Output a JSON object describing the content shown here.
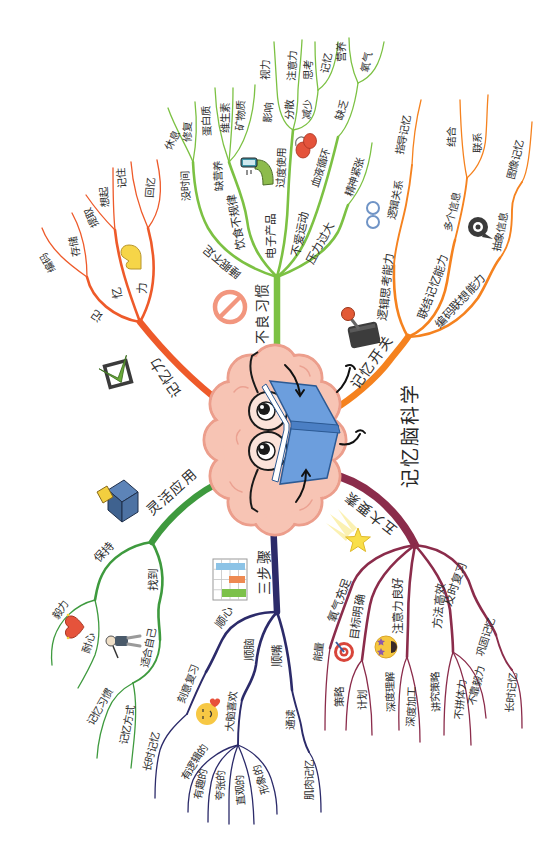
{
  "title": "记忆脑科学",
  "central_image": {
    "icon": "brain-reading-book-icon"
  },
  "branches": [
    {
      "label": "记忆力",
      "color": "#ee5a2a",
      "icon": "checkbox-icon",
      "children": [
        {
          "label": "记",
          "children": [
            {
              "label": "编码"
            },
            {
              "label": "存储"
            }
          ]
        },
        {
          "label": "忆",
          "children": [
            {
              "label": "提取"
            },
            {
              "label": "想起"
            }
          ]
        },
        {
          "label": "力",
          "icon": "flexed-arm-icon",
          "children": [
            {
              "label": "记住"
            },
            {
              "label": "回忆"
            }
          ]
        }
      ]
    },
    {
      "label": "不良习惯",
      "color": "#7cc143",
      "icon": "prohibition-icon",
      "children": [
        {
          "label": "睡眠不足",
          "children": [
            {
              "label": "没时间",
              "children": [
                {
                  "label": "休息"
                },
                {
                  "label": "修复"
                }
              ]
            }
          ]
        },
        {
          "label": "饮食不规律",
          "children": [
            {
              "label": "缺营养",
              "children": [
                {
                  "label": "蛋白质"
                },
                {
                  "label": "维生素"
                },
                {
                  "label": "矿物质"
                }
              ]
            }
          ]
        },
        {
          "label": "电子产品",
          "icon": "phone-hand-icon",
          "children": [
            {
              "label": "过度使用",
              "children": [
                {
                  "label": "影响",
                  "children": [
                    {
                      "label": "视力"
                    }
                  ]
                },
                {
                  "label": "分散",
                  "children": [
                    {
                      "label": "注意力"
                    }
                  ]
                },
                {
                  "label": "减少",
                  "children": [
                    {
                      "label": "思考"
                    },
                    {
                      "label": "记忆"
                    }
                  ]
                }
              ]
            }
          ]
        },
        {
          "label": "不爱运动",
          "icon": "lungs-icon",
          "children": [
            {
              "label": "血液循环",
              "children": [
                {
                  "label": "缺乏",
                  "children": [
                    {
                      "label": "营养"
                    },
                    {
                      "label": "氧气"
                    }
                  ]
                }
              ]
            }
          ]
        },
        {
          "label": "压力过大",
          "children": [
            {
              "label": "精神紧张"
            }
          ]
        }
      ]
    },
    {
      "label": "记忆开关",
      "color": "#f5821f",
      "icon": "joystick-icon",
      "children": [
        {
          "label": "逻辑思考能力",
          "icon": "glasses-icon",
          "children": [
            {
              "label": "逻辑关系",
              "children": [
                {
                  "label": "指导记忆"
                }
              ]
            }
          ]
        },
        {
          "label": "联结记忆能力",
          "children": [
            {
              "label": "多个信息",
              "children": [
                {
                  "label": "结合"
                },
                {
                  "label": "联系"
                }
              ]
            }
          ]
        },
        {
          "label": "编码联想能力",
          "icon": "eye-bubble-icon",
          "children": [
            {
              "label": "抽象信息",
              "children": [
                {
                  "label": "图像记忆"
                }
              ]
            }
          ]
        }
      ]
    },
    {
      "label": "五大要素",
      "color": "#8b2c4b",
      "icon": "shooting-star-icon",
      "children": [
        {
          "label": "氧气充足",
          "children": [
            {
              "label": "能量"
            }
          ]
        },
        {
          "label": "目标明确",
          "icon": "target-icon",
          "children": [
            {
              "label": "策略"
            },
            {
              "label": "计划"
            }
          ]
        },
        {
          "label": "注意力良好",
          "icon": "star-eyes-emoji-icon",
          "children": [
            {
              "label": "深度理解"
            },
            {
              "label": "深度加工"
            }
          ]
        },
        {
          "label": "方法高效",
          "children": [
            {
              "label": "讲究策略"
            },
            {
              "label": "不拼体力"
            },
            {
              "label": "不靠毅力"
            }
          ]
        },
        {
          "label": "及时复习",
          "children": [
            {
              "label": "巩固记忆",
              "children": [
                {
                  "label": "长时记忆"
                }
              ]
            }
          ]
        }
      ]
    },
    {
      "label": "三步骤",
      "color": "#2c2b6a",
      "icon": "schedule-chart-icon",
      "children": [
        {
          "label": "顺心",
          "children": [
            {
              "label": "刻意复习",
              "children": [
                {
                  "label": "长时记忆"
                }
              ]
            }
          ]
        },
        {
          "label": "顺脑",
          "icon": "smiley-heart-icon",
          "children": [
            {
              "label": "大脑喜欢",
              "children": [
                {
                  "label": "有逻辑的"
                },
                {
                  "label": "有趣的"
                },
                {
                  "label": "夸张的"
                },
                {
                  "label": "直观的"
                },
                {
                  "label": "形象的"
                }
              ]
            }
          ]
        },
        {
          "label": "顺嘴",
          "children": [
            {
              "label": "通读",
              "children": [
                {
                  "label": "肌肉记忆"
                }
              ]
            }
          ]
        }
      ]
    },
    {
      "label": "灵活应用",
      "color": "#3e9a3e",
      "icon": "box-icon",
      "children": [
        {
          "label": "保持",
          "icon": "heart-icon",
          "children": [
            {
              "label": "毅力"
            },
            {
              "label": "耐心"
            }
          ]
        },
        {
          "label": "找到",
          "children": [
            {
              "label": "适合自己",
              "icon": "person-icon",
              "children": [
                {
                  "label": "记忆习惯"
                },
                {
                  "label": "记忆方式"
                }
              ]
            }
          ]
        }
      ]
    }
  ]
}
